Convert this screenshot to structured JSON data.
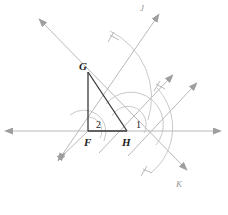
{
  "figure": {
    "stroke_dark": "#3a3a3a",
    "stroke_light": "#b9b9b9",
    "stroke_arc": "#c2c2c2",
    "background": "#ffffff"
  },
  "vertices": [
    {
      "id": "G",
      "label": "G",
      "x": 88,
      "y": 72,
      "label_x": 79,
      "label_y": 63
    },
    {
      "id": "F",
      "label": "F",
      "x": 88,
      "y": 131,
      "label_x": 84,
      "label_y": 139
    },
    {
      "id": "H",
      "label": "H",
      "x": 127,
      "y": 131,
      "label_x": 122,
      "label_y": 139
    }
  ],
  "angles": [
    {
      "id": "2",
      "label": "2",
      "at": "F",
      "label_x": 96,
      "label_y": 122
    },
    {
      "id": "1",
      "label": "1",
      "at": "H",
      "label_x": 136,
      "label_y": 122
    }
  ],
  "ray_labels": [
    {
      "id": "J",
      "label": "J",
      "label_x": 140,
      "label_y": 5,
      "at_ray": "upper-right-ray-j"
    },
    {
      "id": "K",
      "label": "K",
      "label_x": 176,
      "label_y": 182,
      "at_ray": "lower-right-ray-k"
    }
  ],
  "lines": [
    {
      "name": "horizontal-line",
      "from_x": 4,
      "from_y": 131,
      "to_x": 222,
      "to_y": 131,
      "arrows": "both",
      "weight": "light"
    },
    {
      "name": "line-through-g-upper-left",
      "from_x": 38,
      "from_y": 18,
      "to_x": 186,
      "to_y": 169,
      "arrows": "both",
      "weight": "light"
    },
    {
      "name": "ray-j-through-h",
      "from_x": 58,
      "from_y": 160,
      "to_x": 160,
      "to_y": 14,
      "arrows": "start-end",
      "weight": "light"
    },
    {
      "name": "ray-middle-parallel",
      "from_x": 97,
      "from_y": 156,
      "to_x": 172,
      "to_y": 76,
      "arrows": "end",
      "weight": "light"
    },
    {
      "name": "ray-k-lower-right",
      "from_x": 126,
      "from_y": 160,
      "to_x": 196,
      "to_y": 84,
      "arrows": "end",
      "weight": "light"
    },
    {
      "name": "triangle-leg-fg",
      "from_x": 88,
      "from_y": 72,
      "to_x": 88,
      "to_y": 131,
      "arrows": "none",
      "weight": "dark"
    },
    {
      "name": "triangle-leg-fh",
      "from_x": 88,
      "from_y": 131,
      "to_x": 127,
      "to_y": 131,
      "arrows": "none",
      "weight": "dark"
    },
    {
      "name": "triangle-hyp-gh",
      "from_x": 88,
      "from_y": 72,
      "to_x": 127,
      "to_y": 131,
      "arrows": "none",
      "weight": "dark"
    }
  ]
}
